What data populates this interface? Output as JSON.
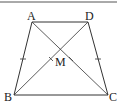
{
  "figure": {
    "type": "isosceles-trapezoid",
    "stroke_color": "#333333",
    "points": {
      "A": {
        "label": "A",
        "x": 32,
        "y": 22
      },
      "D": {
        "label": "D",
        "x": 88,
        "y": 22
      },
      "B": {
        "label": "B",
        "x": 14,
        "y": 95
      },
      "C": {
        "label": "C",
        "x": 108,
        "y": 95
      },
      "M": {
        "label": "M",
        "x": 61,
        "y": 50
      }
    },
    "segments": [
      "AD",
      "BC",
      "AB",
      "DC",
      "AC",
      "BD"
    ],
    "equal_marks": [
      "AB",
      "DC",
      "MB",
      "MC"
    ]
  }
}
